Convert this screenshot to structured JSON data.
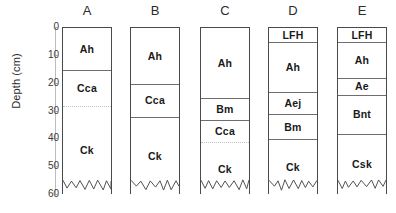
{
  "chart_data": {
    "type": "diagram",
    "title": "",
    "ylabel": "Depth (cm)",
    "ylim": [
      0,
      60
    ],
    "yticks": [
      0,
      10,
      20,
      30,
      40,
      50,
      60
    ],
    "y_axis_direction": "inverted",
    "units": "cm",
    "grid": false,
    "legend": "none",
    "note": "Soil profile columns with horizon designations; wavy bottom edge denotes unbounded depth.",
    "categories": [
      "A",
      "B",
      "C",
      "D",
      "E"
    ],
    "profiles": [
      {
        "label": "A",
        "horizons": [
          {
            "name": "Ah",
            "top": 0,
            "bottom": 15,
            "boundary": "solid"
          },
          {
            "name": "Cca",
            "top": 15,
            "bottom": 28,
            "boundary": "dotted"
          },
          {
            "name": "Ck",
            "top": 28,
            "bottom": 60,
            "boundary": "wavy"
          }
        ]
      },
      {
        "label": "B",
        "horizons": [
          {
            "name": "Ah",
            "top": 0,
            "bottom": 20,
            "boundary": "solid"
          },
          {
            "name": "Cca",
            "top": 20,
            "bottom": 32,
            "boundary": "solid"
          },
          {
            "name": "Ck",
            "top": 32,
            "bottom": 60,
            "boundary": "wavy"
          }
        ]
      },
      {
        "label": "C",
        "horizons": [
          {
            "name": "Ah",
            "top": 0,
            "bottom": 25,
            "boundary": "solid"
          },
          {
            "name": "Bm",
            "top": 25,
            "bottom": 33,
            "boundary": "solid"
          },
          {
            "name": "Cca",
            "top": 33,
            "bottom": 41,
            "boundary": "dotted"
          },
          {
            "name": "Ck",
            "top": 41,
            "bottom": 60,
            "boundary": "wavy"
          }
        ]
      },
      {
        "label": "D",
        "horizons": [
          {
            "name": "LFH",
            "top": 0,
            "bottom": 5,
            "boundary": "solid"
          },
          {
            "name": "Ah",
            "top": 5,
            "bottom": 23,
            "boundary": "solid"
          },
          {
            "name": "Aej",
            "top": 23,
            "bottom": 31,
            "boundary": "solid"
          },
          {
            "name": "Bm",
            "top": 31,
            "bottom": 40,
            "boundary": "solid"
          },
          {
            "name": "Ck",
            "top": 40,
            "bottom": 60,
            "boundary": "wavy"
          }
        ]
      },
      {
        "label": "E",
        "horizons": [
          {
            "name": "LFH",
            "top": 0,
            "bottom": 5,
            "boundary": "solid"
          },
          {
            "name": "Ah",
            "top": 5,
            "bottom": 18,
            "boundary": "solid"
          },
          {
            "name": "Ae",
            "top": 18,
            "bottom": 24,
            "boundary": "solid"
          },
          {
            "name": "Bnt",
            "top": 24,
            "bottom": 38,
            "boundary": "solid"
          },
          {
            "name": "Csk",
            "top": 38,
            "bottom": 60,
            "boundary": "wavy"
          }
        ]
      }
    ],
    "colors": {
      "column_border": "#4a4a4a",
      "horizon_divider": "#6e6e6e",
      "dotted_divider": "#c4c4c4",
      "axis": "#bdbdbd",
      "text": "#1a1a1a",
      "background": "#ffffff"
    },
    "layout": {
      "plot_top_px": 27,
      "plot_height_px": 167,
      "column_width_px": 50,
      "column_x_px": [
        62,
        130,
        200,
        268,
        337
      ]
    }
  }
}
